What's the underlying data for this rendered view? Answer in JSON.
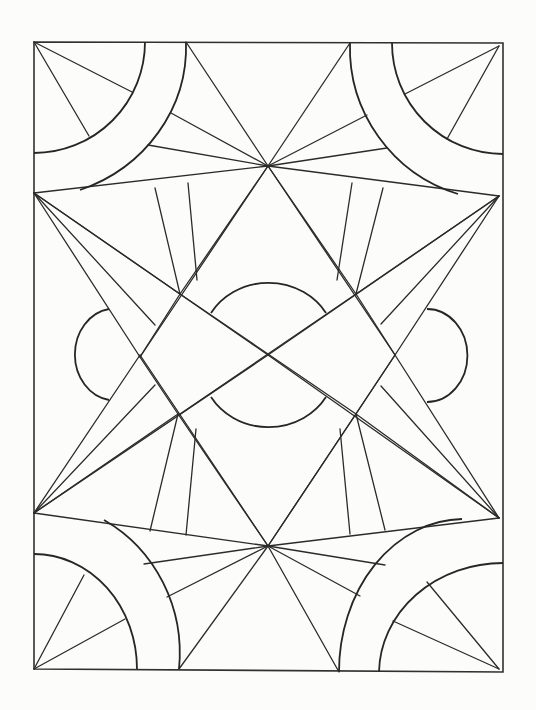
{
  "artwork": {
    "kind": "geometric coloring page",
    "ink_color": "#2b2b2b",
    "paper_color": "#fcfcfb",
    "frame": {
      "x1": 34,
      "y1": 42,
      "x2": 503,
      "y2": 671
    },
    "focal_points": {
      "top_star": [
        268,
        166
      ],
      "bottom_star": [
        268,
        546
      ],
      "center_cross": [
        268,
        355
      ],
      "left_upper": [
        34,
        193
      ],
      "left_lower": [
        34,
        513
      ],
      "right_upper": [
        499,
        196
      ],
      "right_lower": [
        499,
        518
      ]
    }
  }
}
